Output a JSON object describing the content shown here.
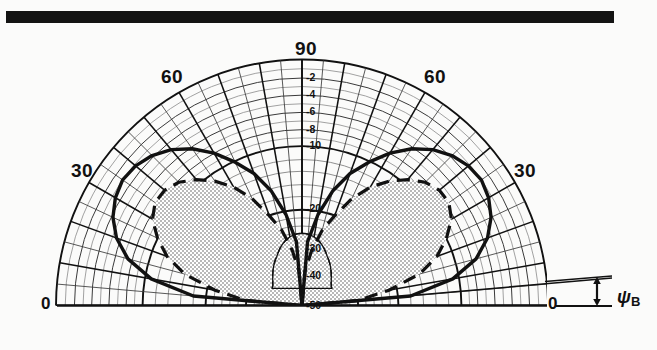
{
  "figure": {
    "type": "polar-radiation-pattern",
    "top_rule": "solid-black-bar"
  },
  "labels": {
    "angle_90": "90",
    "angle_60_left": "60",
    "angle_60_right": "60",
    "angle_30_left": "30",
    "angle_30_right": "30",
    "angle_0_left": "0",
    "angle_0_right": "0",
    "beamwidth_symbol": "ψ",
    "beamwidth_subscript": "B"
  },
  "colors": {
    "ink": "#111111",
    "grid_minor": "#3a3a3a",
    "grid_major": "#111111",
    "fill_stipple": "#d8d8d8",
    "paper": "#fbfbfa"
  },
  "chart_data": {
    "type": "line",
    "title": "",
    "subtitle": "",
    "xlabel": "",
    "ylabel": "",
    "projection": "polar-half",
    "grid": true,
    "legend_position": "none",
    "angle_axis": {
      "label": "Elevation angle (degrees)",
      "min": 0,
      "max": 180,
      "tick_labels": [
        "0",
        "30",
        "60",
        "90",
        "60",
        "30",
        "0"
      ],
      "tick_values": [
        0,
        30,
        60,
        90,
        120,
        150,
        180
      ],
      "minor_tick_step": 5,
      "major_tick_step": 10
    },
    "radial_axis": {
      "label": "Relative power (dB)",
      "unit": "dB",
      "tick_labels": [
        "-2",
        "-4",
        "-6",
        "-8",
        "-10",
        "-20",
        "-30",
        "-40",
        "-50"
      ],
      "tick_values": [
        -2,
        -4,
        -6,
        -8,
        -10,
        -20,
        -30,
        -40,
        -50
      ],
      "outer_value": 0,
      "center_value": -50,
      "scale": "compressed-log"
    },
    "annotations": [
      {
        "name": "beamwidth-marker",
        "text": "ψB",
        "description": "double-headed vertical arrow indicating beam tilt angle psi-B above the horizon baseline at right edge"
      }
    ],
    "series": [
      {
        "name": "measured-pattern",
        "style": "solid-thick",
        "description": "two symmetric main lobes peaking near 35 and 145 degrees with deep null at 90 degrees",
        "angles": [
          0,
          5,
          10,
          15,
          20,
          25,
          30,
          35,
          40,
          45,
          50,
          55,
          60,
          65,
          70,
          75,
          80,
          85,
          90,
          95,
          100,
          105,
          110,
          115,
          120,
          125,
          130,
          135,
          140,
          145,
          150,
          155,
          160,
          165,
          170,
          175,
          180
        ],
        "values_db": [
          -50,
          -18,
          -11,
          -7.5,
          -5.5,
          -4.2,
          -3.4,
          -3.0,
          -3.2,
          -3.8,
          -4.8,
          -6.2,
          -8.0,
          -10.2,
          -13.0,
          -16.5,
          -21.0,
          -28.0,
          -50,
          -28.0,
          -21.0,
          -16.5,
          -13.0,
          -10.2,
          -8.0,
          -6.2,
          -4.8,
          -3.8,
          -3.2,
          -3.0,
          -3.4,
          -4.2,
          -5.5,
          -7.5,
          -11,
          -18,
          -50
        ]
      },
      {
        "name": "theoretical-pattern",
        "style": "dashed-thick",
        "description": "narrower dashed reference lobes inside the measured pattern",
        "angles": [
          0,
          5,
          10,
          15,
          20,
          25,
          30,
          35,
          40,
          45,
          50,
          55,
          60,
          65,
          70,
          75,
          80,
          85,
          90,
          95,
          100,
          105,
          110,
          115,
          120,
          125,
          130,
          135,
          140,
          145,
          150,
          155,
          160,
          165,
          170,
          175,
          180
        ],
        "values_db": [
          -50,
          -30,
          -22,
          -16,
          -12.5,
          -10.0,
          -8.4,
          -7.6,
          -7.6,
          -8.2,
          -9.4,
          -11.2,
          -13.6,
          -16.6,
          -20.2,
          -24.6,
          -30.0,
          -38.0,
          -50,
          -38.0,
          -30.0,
          -24.6,
          -20.2,
          -16.6,
          -13.6,
          -11.2,
          -9.4,
          -8.2,
          -7.6,
          -7.6,
          -8.4,
          -10.0,
          -12.5,
          -16,
          -22,
          -30,
          -50
        ]
      },
      {
        "name": "shaded-region",
        "style": "stippled-fill",
        "description": "gray stippled area filling the interior of the lobes between pattern curve and origin"
      },
      {
        "name": "central-lobe",
        "style": "solid-thin",
        "description": "small residual lobe near the origin around 90 degrees reaching about -38 dB"
      }
    ]
  }
}
